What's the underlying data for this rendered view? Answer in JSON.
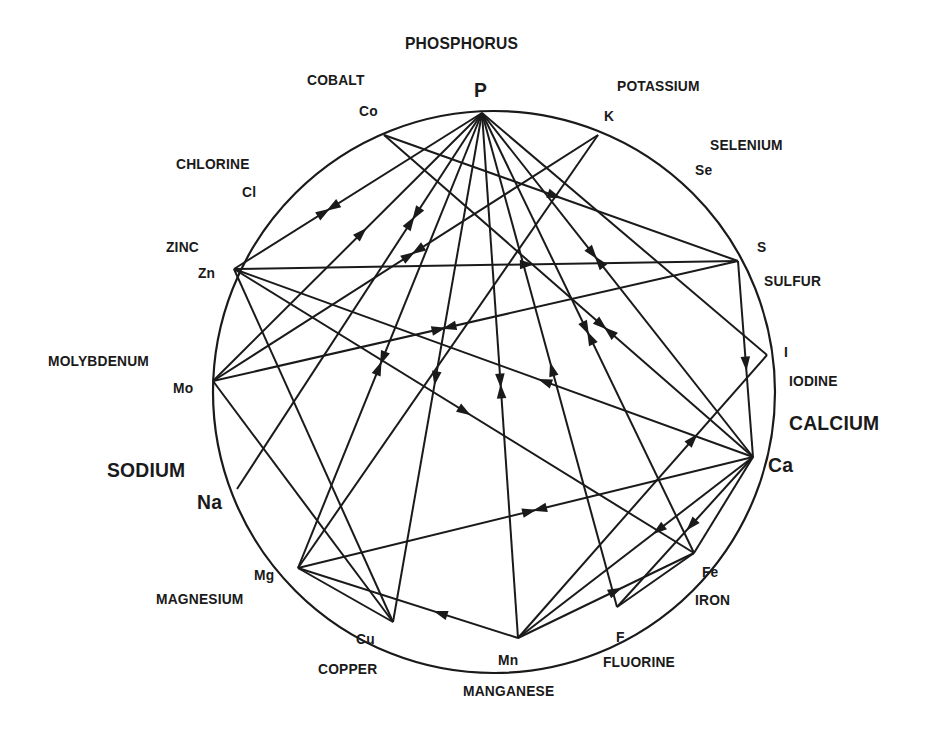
{
  "diagram": {
    "circle": {
      "cx": 494,
      "cy": 392,
      "r": 281,
      "stroke": "#1a1a1a"
    },
    "nodes": [
      {
        "id": "P",
        "symbol": "P",
        "name": "PHOSPHORUS",
        "x": 482,
        "y": 113
      },
      {
        "id": "Co",
        "symbol": "Co",
        "name": "COBALT",
        "x": 384,
        "y": 135
      },
      {
        "id": "K",
        "symbol": "K",
        "name": "POTASSIUM",
        "x": 598,
        "y": 135
      },
      {
        "id": "Se",
        "symbol": "Se",
        "name": "SELENIUM",
        "x": 712,
        "y": 200
      },
      {
        "id": "S",
        "symbol": "S",
        "name": "SULFUR",
        "x": 738,
        "y": 261
      },
      {
        "id": "I",
        "symbol": "I",
        "name": "IODINE",
        "x": 767,
        "y": 355
      },
      {
        "id": "Ca",
        "symbol": "Ca",
        "name": "CALCIUM",
        "x": 753,
        "y": 457
      },
      {
        "id": "Fe",
        "symbol": "Fe",
        "name": "IRON",
        "x": 694,
        "y": 553
      },
      {
        "id": "F",
        "symbol": "F",
        "name": "FLUORINE",
        "x": 617,
        "y": 607
      },
      {
        "id": "Mn",
        "symbol": "Mn",
        "name": "MANGANESE",
        "x": 518,
        "y": 638
      },
      {
        "id": "Cu",
        "symbol": "Cu",
        "name": "COPPER",
        "x": 393,
        "y": 622
      },
      {
        "id": "Mg",
        "symbol": "Mg",
        "name": "MAGNESIUM",
        "x": 298,
        "y": 568
      },
      {
        "id": "Na",
        "symbol": "Na",
        "name": "SODIUM",
        "x": 237,
        "y": 489
      },
      {
        "id": "Mo",
        "symbol": "Mo",
        "name": "MOLYBDENUM",
        "x": 213,
        "y": 381
      },
      {
        "id": "Zn",
        "symbol": "Zn",
        "name": "ZINC",
        "x": 234,
        "y": 269
      },
      {
        "id": "Cl",
        "symbol": "Cl",
        "name": "CHLORINE",
        "x": 275,
        "y": 200
      }
    ],
    "connections": [
      {
        "from": "P",
        "to": "Zn",
        "marker": "double",
        "t": 0.62
      },
      {
        "from": "P",
        "to": "Mo",
        "marker": "arrow-from",
        "t": 0.45
      },
      {
        "from": "P",
        "to": "Na",
        "marker": "double",
        "t": 0.28
      },
      {
        "from": "P",
        "to": "Mg",
        "marker": "double",
        "t": 0.55
      },
      {
        "from": "P",
        "to": "Cu",
        "marker": "arrow-to",
        "t": 0.52
      },
      {
        "from": "P",
        "to": "Mn",
        "marker": "double",
        "t": 0.52
      },
      {
        "from": "P",
        "to": "Fe",
        "marker": "double",
        "t": 0.5
      },
      {
        "from": "P",
        "to": "Ca",
        "marker": "double",
        "t": 0.42
      },
      {
        "from": "P",
        "to": "F",
        "marker": "arrow-from",
        "t": 0.52
      },
      {
        "from": "P",
        "to": "I",
        "marker": "none",
        "t": 0.5
      },
      {
        "from": "Co",
        "to": "S",
        "marker": "arrow-to",
        "t": 0.48
      },
      {
        "from": "Co",
        "to": "Ca",
        "marker": "double",
        "t": 0.6
      },
      {
        "from": "K",
        "to": "Mo",
        "marker": "double",
        "t": 0.48
      },
      {
        "from": "Zn",
        "to": "S",
        "marker": "arrow-to",
        "t": 0.58
      },
      {
        "from": "Zn",
        "to": "Ca",
        "marker": "arrow-from",
        "t": 0.6
      },
      {
        "from": "Zn",
        "to": "Fe",
        "marker": "arrow-to",
        "t": 0.5
      },
      {
        "from": "Zn",
        "to": "Cu",
        "marker": "none",
        "t": 0.5
      },
      {
        "from": "S",
        "to": "Mo",
        "marker": "double",
        "t": 0.56
      },
      {
        "from": "S",
        "to": "Ca",
        "marker": "arrow-to",
        "t": 0.52
      },
      {
        "from": "I",
        "to": "Mn",
        "marker": "arrow-from",
        "t": 0.3
      },
      {
        "from": "Ca",
        "to": "Mg",
        "marker": "double",
        "t": 0.48
      },
      {
        "from": "Ca",
        "to": "Mn",
        "marker": "arrow-to",
        "t": 0.4
      },
      {
        "from": "Ca",
        "to": "F",
        "marker": "arrow-to",
        "t": 0.45
      },
      {
        "from": "Ca",
        "to": "Fe",
        "marker": "none",
        "t": 0.5
      },
      {
        "from": "Fe",
        "to": "Mn",
        "marker": "arrow-from",
        "t": 0.45
      },
      {
        "from": "Fe",
        "to": "F",
        "marker": "none",
        "t": 0.5
      },
      {
        "from": "Mo",
        "to": "Cu",
        "marker": "none",
        "t": 0.5
      },
      {
        "from": "Mn",
        "to": "Mg",
        "marker": "arrow-to",
        "t": 0.35
      },
      {
        "from": "Mg",
        "to": "Cu",
        "marker": "none",
        "t": 0.5
      },
      {
        "from": "Mg",
        "to": "K",
        "marker": "none",
        "t": 0.5
      }
    ]
  },
  "labels": [
    {
      "key": "phosphorus",
      "text": "PHOSPHORUS",
      "x": 405,
      "y": 34,
      "size": "md"
    },
    {
      "key": "p",
      "text": "P",
      "x": 474,
      "y": 78,
      "size": "lg"
    },
    {
      "key": "cobalt",
      "text": "COBALT",
      "x": 307,
      "y": 71,
      "size": "sm"
    },
    {
      "key": "co",
      "text": "Co",
      "x": 359,
      "y": 102,
      "size": "sm"
    },
    {
      "key": "potassium",
      "text": "POTASSIUM",
      "x": 617,
      "y": 77,
      "size": "sm"
    },
    {
      "key": "k",
      "text": "K",
      "x": 604,
      "y": 107,
      "size": "sm"
    },
    {
      "key": "selenium",
      "text": "SELENIUM",
      "x": 710,
      "y": 136,
      "size": "sm"
    },
    {
      "key": "se",
      "text": "Se",
      "x": 695,
      "y": 161,
      "size": "sm"
    },
    {
      "key": "chlorine",
      "text": "CHLORINE",
      "x": 176,
      "y": 155,
      "size": "sm"
    },
    {
      "key": "cl",
      "text": "Cl",
      "x": 242,
      "y": 183,
      "size": "sm"
    },
    {
      "key": "zinc",
      "text": "ZINC",
      "x": 166,
      "y": 238,
      "size": "sm"
    },
    {
      "key": "zn",
      "text": "Zn",
      "x": 198,
      "y": 264,
      "size": "sm"
    },
    {
      "key": "s",
      "text": "S",
      "x": 757,
      "y": 238,
      "size": "sm"
    },
    {
      "key": "sulfur",
      "text": "SULFUR",
      "x": 764,
      "y": 272,
      "size": "sm"
    },
    {
      "key": "i",
      "text": "I",
      "x": 784,
      "y": 343,
      "size": "sm"
    },
    {
      "key": "iodine",
      "text": "IODINE",
      "x": 789,
      "y": 372,
      "size": "sm"
    },
    {
      "key": "calcium",
      "text": "CALCIUM",
      "x": 789,
      "y": 411,
      "size": "lg"
    },
    {
      "key": "ca",
      "text": "Ca",
      "x": 768,
      "y": 453,
      "size": "lg"
    },
    {
      "key": "molybdenum",
      "text": "MOLYBDENUM",
      "x": 48,
      "y": 352,
      "size": "sm"
    },
    {
      "key": "mo",
      "text": "Mo",
      "x": 173,
      "y": 379,
      "size": "sm"
    },
    {
      "key": "sodium",
      "text": "SODIUM",
      "x": 107,
      "y": 458,
      "size": "lg"
    },
    {
      "key": "na",
      "text": "Na",
      "x": 197,
      "y": 490,
      "size": "lg"
    },
    {
      "key": "mg",
      "text": "Mg",
      "x": 254,
      "y": 566,
      "size": "sm"
    },
    {
      "key": "magnesium",
      "text": "MAGNESIUM",
      "x": 156,
      "y": 590,
      "size": "sm"
    },
    {
      "key": "cu",
      "text": "Cu",
      "x": 356,
      "y": 630,
      "size": "sm"
    },
    {
      "key": "copper",
      "text": "COPPER",
      "x": 318,
      "y": 660,
      "size": "sm"
    },
    {
      "key": "mn",
      "text": "Mn",
      "x": 498,
      "y": 651,
      "size": "sm"
    },
    {
      "key": "manganese",
      "text": "MANGANESE",
      "x": 463,
      "y": 682,
      "size": "sm"
    },
    {
      "key": "fe",
      "text": "Fe",
      "x": 702,
      "y": 563,
      "size": "sm"
    },
    {
      "key": "iron",
      "text": "IRON",
      "x": 695,
      "y": 591,
      "size": "sm"
    },
    {
      "key": "f",
      "text": "F",
      "x": 616,
      "y": 628,
      "size": "sm"
    },
    {
      "key": "fluorine",
      "text": "FLUORINE",
      "x": 603,
      "y": 653,
      "size": "sm"
    }
  ]
}
